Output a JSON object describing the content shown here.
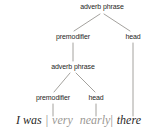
{
  "diagram": {
    "type": "syntactic-tree",
    "colors": {
      "line": "#9a9793",
      "label_text": "#262524",
      "word_dark": "#2a2827",
      "word_light": "#9b9894",
      "separator": "#8d8a86",
      "background": "#ffffff"
    },
    "nodes": {
      "root": "adverb phrase",
      "level2_left": "premodifier",
      "level2_right": "head",
      "level3": "adverb phrase",
      "level4_left": "premodifier",
      "level4_right": "head"
    },
    "sentence": {
      "word1": "I was",
      "sep1": "|",
      "word2": "very",
      "word3": "nearly",
      "sep2": "|",
      "word4": "there"
    }
  }
}
